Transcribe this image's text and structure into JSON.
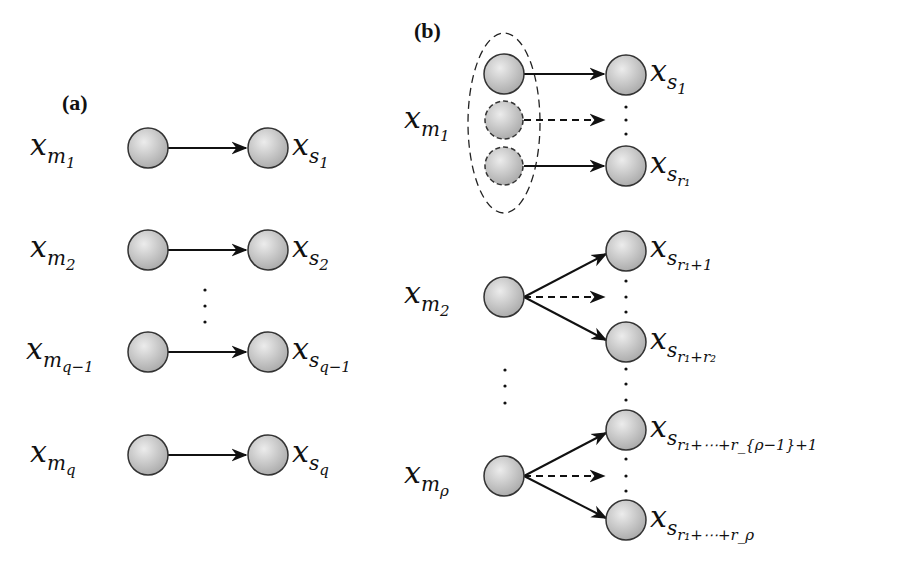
{
  "panels": {
    "a": {
      "label": "(a)",
      "rows": [
        {
          "master": "x",
          "master_sub": "m",
          "master_subsub": "1",
          "slave": "x",
          "slave_sub": "s",
          "slave_subsub": "1"
        },
        {
          "master": "x",
          "master_sub": "m",
          "master_subsub": "2",
          "slave": "x",
          "slave_sub": "s",
          "slave_subsub": "2"
        },
        {
          "master": "x",
          "master_sub": "m",
          "master_subsub": "q−1",
          "slave": "x",
          "slave_sub": "s",
          "slave_subsub": "q−1"
        },
        {
          "master": "x",
          "master_sub": "m",
          "master_subsub": "q",
          "slave": "x",
          "slave_sub": "s",
          "slave_subsub": "q"
        }
      ],
      "ellipsis": "⋮"
    },
    "b": {
      "label": "(b)",
      "groups": [
        {
          "master": "x",
          "master_sub": "m",
          "master_subsub": "1",
          "targets": [
            {
              "x": "x",
              "sub": "s",
              "subsub": "1"
            },
            {
              "x": "x",
              "sub": "s",
              "subsub": "r₁"
            }
          ]
        },
        {
          "master": "x",
          "master_sub": "m",
          "master_subsub": "2",
          "targets": [
            {
              "x": "x",
              "sub": "s",
              "subsub": "r₁+1"
            },
            {
              "x": "x",
              "sub": "s",
              "subsub": "r₁+r₂"
            }
          ]
        },
        {
          "master": "x",
          "master_sub": "m",
          "master_subsub": "ρ",
          "targets": [
            {
              "x": "x",
              "sub": "s",
              "subsub": "r₁+⋯+r_{ρ−1}+1"
            },
            {
              "x": "x",
              "sub": "s",
              "subsub": "r₁+⋯+r_ρ"
            }
          ]
        }
      ]
    }
  },
  "colors": {
    "node_fill_light": "#e6e6e6",
    "node_fill_dark": "#a9a9a9",
    "node_stroke": "#333333",
    "edge": "#111111"
  }
}
